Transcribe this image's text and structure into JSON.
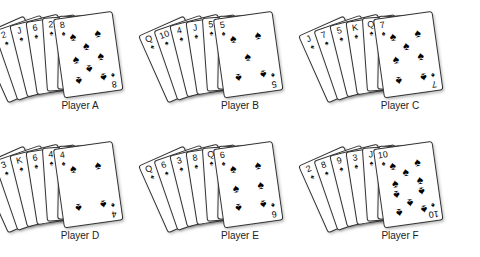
{
  "players": [
    {
      "label": "Player A",
      "cards": [
        "10",
        "2",
        "J",
        "6",
        "2",
        "9",
        "8"
      ],
      "front_pips": 8,
      "suit_symbol": "♠"
    },
    {
      "label": "Player B",
      "cards": [
        "Q",
        "10",
        "4",
        "J",
        "5",
        "J",
        "5"
      ],
      "front_pips": 5,
      "suit_symbol": "♠"
    },
    {
      "label": "Player C",
      "cards": [
        "J",
        "7",
        "5",
        "K",
        "Q",
        "5",
        "7"
      ],
      "front_pips": 7,
      "suit_symbol": "♠"
    },
    {
      "label": "Player D",
      "cards": [
        "K",
        "3",
        "K",
        "6",
        "4",
        "9",
        "4"
      ],
      "front_pips": 4,
      "suit_symbol": "♠"
    },
    {
      "label": "Player E",
      "cards": [
        "Q",
        "6",
        "3",
        "8",
        "Q",
        "10",
        "6"
      ],
      "front_pips": 6,
      "suit_symbol": "♠"
    },
    {
      "label": "Player F",
      "cards": [
        "2",
        "8",
        "9",
        "3",
        "J",
        "Q",
        "10"
      ],
      "front_pips": 10,
      "suit_symbol": "♠"
    }
  ],
  "colors": {
    "background": "#ffffff",
    "card_border": "#333333",
    "pip": "#000000",
    "label": "#222222"
  }
}
